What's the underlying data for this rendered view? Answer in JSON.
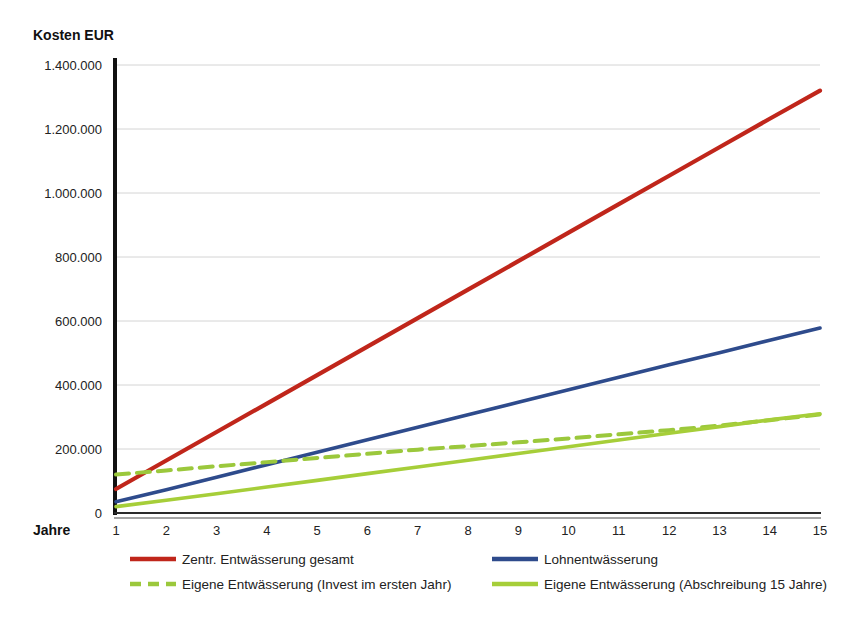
{
  "chart_data": {
    "type": "line",
    "title": "",
    "ylabel": "Kosten EUR",
    "xlabel": "Jahre",
    "x": [
      1,
      2,
      3,
      4,
      5,
      6,
      7,
      8,
      9,
      10,
      11,
      12,
      13,
      14,
      15
    ],
    "xtick_labels": [
      "1",
      "2",
      "3",
      "4",
      "5",
      "6",
      "7",
      "8",
      "9",
      "10",
      "11",
      "12",
      "13",
      "14",
      "15"
    ],
    "ytick_labels": [
      "0",
      "200.000",
      "400.000",
      "600.000",
      "800.000",
      "1.000.000",
      "1.200.000",
      "1.400.000"
    ],
    "ytick_values": [
      0,
      200000,
      400000,
      600000,
      800000,
      1000000,
      1200000,
      1400000
    ],
    "ylim": [
      0,
      1400000
    ],
    "xlim": [
      1,
      15
    ],
    "grid": true,
    "legend_position": "bottom",
    "series": [
      {
        "name": "Zentr. Entwässerung gesamt",
        "color": "#C0261B",
        "style": "solid",
        "width": 4.2,
        "values": [
          75000,
          164000,
          253000,
          342000,
          431000,
          520000,
          609000,
          698000,
          787000,
          876000,
          965000,
          1054000,
          1143000,
          1232000,
          1320000
        ]
      },
      {
        "name": "Lohnentwässerung",
        "color": "#2E4B8C",
        "style": "solid",
        "width": 3.6,
        "values": [
          35000,
          73000,
          112000,
          151000,
          190000,
          229000,
          268000,
          307000,
          346000,
          385000,
          424000,
          463000,
          501000,
          540000,
          578000
        ]
      },
      {
        "name": "Eigene Entwässerung (Invest im ersten Jahr)",
        "color": "#9BC83C",
        "style": "dashed",
        "width": 4.0,
        "values": [
          120000,
          133000,
          146000,
          159000,
          172000,
          185000,
          198000,
          209000,
          221000,
          233000,
          246000,
          259000,
          273000,
          290000,
          308000
        ]
      },
      {
        "name": "Eigene Entwässerung (Abschreibung 15 Jahre)",
        "color": "#A6CE39",
        "style": "solid",
        "width": 3.6,
        "values": [
          20000,
          40000,
          60000,
          81000,
          102000,
          123000,
          144000,
          165000,
          186000,
          207000,
          228000,
          249000,
          270000,
          291000,
          310000
        ]
      }
    ],
    "legend_entries": [
      {
        "label": "Zentr. Entwässerung gesamt",
        "color": "#C0261B",
        "style": "solid"
      },
      {
        "label": "Lohnentwässerung",
        "color": "#2E4B8C",
        "style": "solid"
      },
      {
        "label": "Eigene Entwässerung (Invest im ersten Jahr)",
        "color": "#9BC83C",
        "style": "dashed"
      },
      {
        "label": "Eigene Entwässerung (Abschreibung 15 Jahre)",
        "color": "#A6CE39",
        "style": "solid"
      }
    ]
  }
}
